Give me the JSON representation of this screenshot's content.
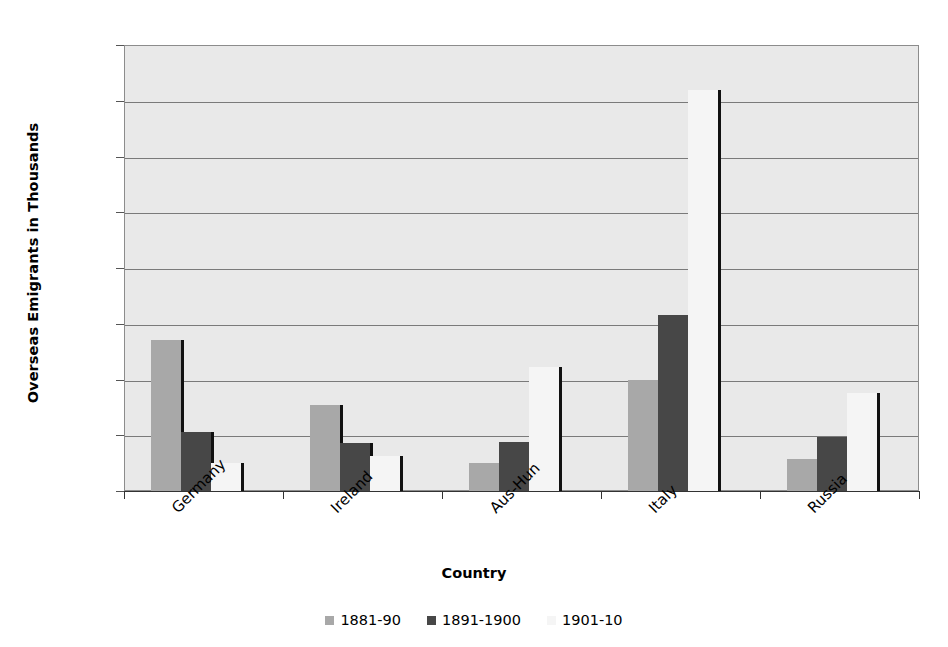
{
  "chart_data": {
    "type": "bar",
    "title": "",
    "xlabel": "Country",
    "ylabel": "Overseas Emigrants in Thousands",
    "categories": [
      "Germany",
      "Ireland",
      "Aus-Hun",
      "Italy",
      "Russia"
    ],
    "series": [
      {
        "name": "1881-90",
        "color": "#a8a8a8",
        "values": [
          1350,
          770,
          250,
          1000,
          290
        ]
      },
      {
        "name": "1891-1900",
        "color": "#474747",
        "values": [
          530,
          430,
          440,
          1580,
          480
        ]
      },
      {
        "name": "1901-10",
        "color": "#f5f5f5",
        "values": [
          250,
          310,
          1110,
          3600,
          880
        ]
      }
    ],
    "ylim": [
      0,
      4000
    ],
    "yticks": [
      0,
      500,
      1000,
      1500,
      2000,
      2500,
      3000,
      3500,
      4000
    ],
    "ytick_labels": [
      "0",
      "500",
      "1000",
      "1500",
      "2000",
      "2500",
      "3000",
      "3500",
      "4000"
    ],
    "grid": true,
    "legend_position": "bottom",
    "plot_background": "#e9e9e9",
    "gridline_color": "#7a7a7a",
    "category_label_rotation": -45
  }
}
